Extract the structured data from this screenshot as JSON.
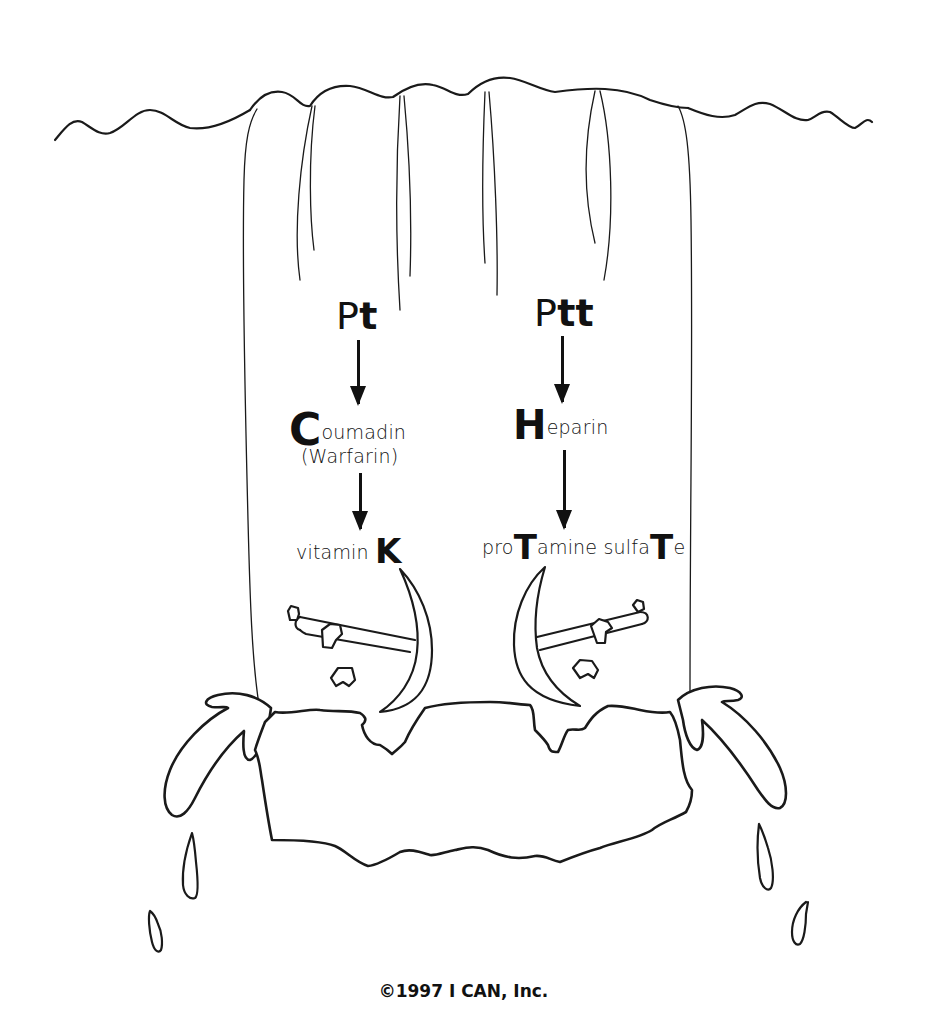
{
  "diagram": {
    "type": "illustration",
    "left_column": {
      "test": {
        "prefix": "P",
        "emph": "t"
      },
      "drug": {
        "initial": "C",
        "rest": "oumadin"
      },
      "drug_alt": "(Warfarin)",
      "antidote": {
        "prefix": "vitamin ",
        "emph": "K"
      }
    },
    "right_column": {
      "test": {
        "prefix": "P",
        "emph": "tt"
      },
      "drug": {
        "initial": "H",
        "rest": "eparin"
      },
      "antidote": {
        "part1": "pro",
        "emph1": "T",
        "part2": "amine sulfa",
        "emph2": "T",
        "part3": "e"
      }
    },
    "footer": {
      "copyright": "©1997 I CAN, Inc."
    },
    "colors": {
      "ink": "#111111",
      "background": "#ffffff"
    }
  }
}
